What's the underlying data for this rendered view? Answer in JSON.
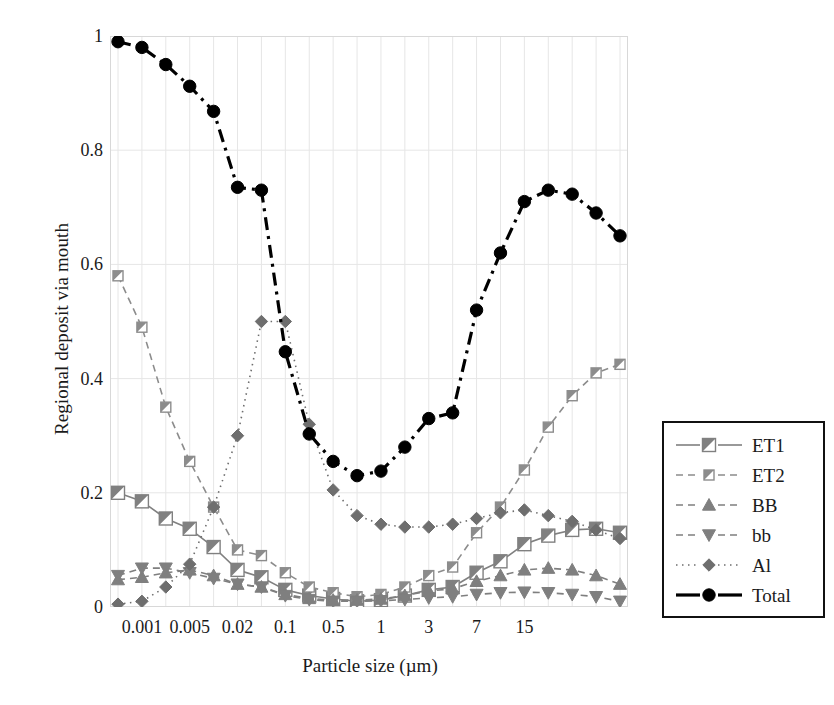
{
  "chart_data": {
    "type": "line",
    "title": "",
    "xlabel": "Particle size (µm)",
    "ylabel": "Regional deposit via mouth",
    "ylim": [
      0,
      1
    ],
    "yticks": [
      0,
      0.2,
      0.4,
      0.6,
      0.8,
      1
    ],
    "ytick_labels": [
      "0",
      "0.2",
      "0.4",
      "0.6",
      "0.8",
      "1"
    ],
    "xtick_labels": [
      "0.001",
      "0.005",
      "0.02",
      "0.1",
      "0.5",
      "1",
      "3",
      "7",
      "15"
    ],
    "xtick_index": [
      1,
      3,
      5,
      7,
      9,
      11,
      13,
      15,
      17
    ],
    "x": [
      0.0005,
      0.001,
      0.002,
      0.003,
      0.005,
      0.008,
      0.01,
      0.02,
      0.03,
      0.05,
      0.1,
      0.2,
      0.5,
      0.8,
      1,
      2,
      3,
      5,
      7,
      10,
      15,
      20
    ],
    "grid": true,
    "legend_position": "right-outside",
    "series": [
      {
        "name": "ET1",
        "marker": "square-half",
        "linestyle": "solid",
        "color": "#808080",
        "values": [
          0.2,
          0.185,
          0.155,
          0.137,
          0.105,
          0.065,
          0.052,
          0.03,
          0.02,
          0.014,
          0.01,
          0.012,
          0.02,
          0.03,
          0.035,
          0.06,
          0.08,
          0.11,
          0.125,
          0.135,
          0.137,
          0.13
        ]
      },
      {
        "name": "ET2",
        "marker": "square-small-half",
        "linestyle": "dashed",
        "color": "#8c8c8c",
        "values": [
          0.58,
          0.49,
          0.35,
          0.255,
          0.175,
          0.1,
          0.09,
          0.06,
          0.035,
          0.025,
          0.018,
          0.022,
          0.035,
          0.055,
          0.07,
          0.13,
          0.175,
          0.24,
          0.315,
          0.37,
          0.41,
          0.425
        ]
      },
      {
        "name": "BB",
        "marker": "triangle-up",
        "linestyle": "dashed",
        "color": "#7f7f7f",
        "values": [
          0.048,
          0.052,
          0.06,
          0.065,
          0.055,
          0.04,
          0.035,
          0.022,
          0.015,
          0.012,
          0.012,
          0.014,
          0.02,
          0.028,
          0.032,
          0.045,
          0.055,
          0.065,
          0.068,
          0.065,
          0.055,
          0.04
        ]
      },
      {
        "name": "bb",
        "marker": "triangle-down",
        "linestyle": "dashed",
        "color": "#7f7f7f",
        "values": [
          0.055,
          0.068,
          0.068,
          0.06,
          0.05,
          0.04,
          0.035,
          0.02,
          0.013,
          0.01,
          0.01,
          0.011,
          0.013,
          0.016,
          0.018,
          0.022,
          0.025,
          0.026,
          0.025,
          0.022,
          0.018,
          0.01
        ]
      },
      {
        "name": "Al",
        "marker": "diamond",
        "linestyle": "dotted",
        "color": "#6e6e6e",
        "values": [
          0.005,
          0.01,
          0.035,
          0.075,
          0.175,
          0.3,
          0.5,
          0.5,
          0.32,
          0.205,
          0.16,
          0.145,
          0.14,
          0.14,
          0.145,
          0.155,
          0.165,
          0.17,
          0.16,
          0.15,
          0.135,
          0.12
        ]
      },
      {
        "name": "Total",
        "marker": "circle",
        "linestyle": "dashdot",
        "color": "#000000",
        "values": [
          0.99,
          0.98,
          0.95,
          0.912,
          0.868,
          0.735,
          0.73,
          0.447,
          0.303,
          0.255,
          0.23,
          0.238,
          0.28,
          0.33,
          0.34,
          0.52,
          0.62,
          0.71,
          0.73,
          0.723,
          0.69,
          0.65
        ]
      }
    ]
  },
  "legend": {
    "items": [
      {
        "label": "ET1",
        "marker": "square-half",
        "linestyle": "solid"
      },
      {
        "label": "ET2",
        "marker": "square-small-half",
        "linestyle": "dashed"
      },
      {
        "label": "BB",
        "marker": "triangle-up",
        "linestyle": "dashed"
      },
      {
        "label": "bb",
        "marker": "triangle-down",
        "linestyle": "dashed"
      },
      {
        "label": "Al",
        "marker": "diamond",
        "linestyle": "dotted"
      },
      {
        "label": "Total",
        "marker": "circle",
        "linestyle": "dashdot"
      }
    ]
  }
}
